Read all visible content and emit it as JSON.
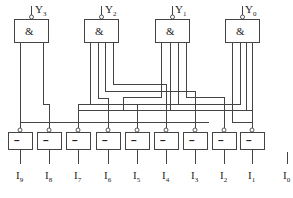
{
  "diagram": {
    "type": "encoder-logic-circuit",
    "and_gates": [
      {
        "id": "g3",
        "output": "Y",
        "output_sub": "3",
        "symbol": "&"
      },
      {
        "id": "g2",
        "output": "Y",
        "output_sub": "2",
        "symbol": "&"
      },
      {
        "id": "g1",
        "output": "Y",
        "output_sub": "1",
        "symbol": "&"
      },
      {
        "id": "g0",
        "output": "Y",
        "output_sub": "0",
        "symbol": "&"
      }
    ],
    "inverters": [
      {
        "input": "I",
        "input_sub": "9",
        "symbol": "–"
      },
      {
        "input": "I",
        "input_sub": "8",
        "symbol": "–"
      },
      {
        "input": "I",
        "input_sub": "7",
        "symbol": "–"
      },
      {
        "input": "I",
        "input_sub": "6",
        "symbol": "–"
      },
      {
        "input": "I",
        "input_sub": "5",
        "symbol": "–"
      },
      {
        "input": "I",
        "input_sub": "4",
        "symbol": "–"
      },
      {
        "input": "I",
        "input_sub": "3",
        "symbol": "–"
      },
      {
        "input": "I",
        "input_sub": "2",
        "symbol": "–"
      },
      {
        "input": "I",
        "input_sub": "1",
        "symbol": "–"
      }
    ],
    "unused_input": {
      "label": "I",
      "sub": "0"
    }
  }
}
